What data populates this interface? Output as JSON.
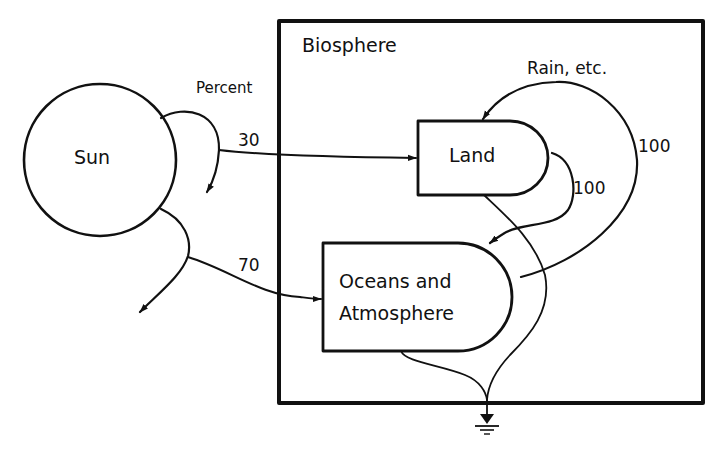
{
  "diagram": {
    "biosphere": {
      "label": "Biosphere"
    },
    "sun": {
      "label": "Sun"
    },
    "percent_label": "Percent",
    "land": {
      "label": "Land"
    },
    "oceans": {
      "label_line1": "Oceans and",
      "label_line2": "Atmosphere"
    },
    "flows": {
      "sun_to_land": "30",
      "sun_to_oceans": "70",
      "land_to_oceans": "100",
      "oceans_to_land": "100",
      "rain_label": "Rain, etc."
    },
    "sink": {
      "icon": "ground-icon"
    },
    "colors": {
      "line": "#111111",
      "background": "#ffffff"
    }
  }
}
